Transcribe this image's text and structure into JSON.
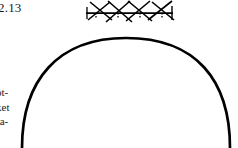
{
  "figure": {
    "number_label": "2.13",
    "caption_lines": [
      "ot-",
      "ket",
      "ra-"
    ],
    "ink_color": "#000000",
    "background_color": "#ffffff"
  },
  "drawing": {
    "arch": {
      "name": "semicircular-arch-curve",
      "left_springing_x": 22,
      "right_springing_x": 230,
      "apex_x": 126,
      "apex_y": 38,
      "baseline_y": 148,
      "stroke_width": 2.6
    },
    "support_hatch": {
      "name": "hatched-support-symbol",
      "line_y": 13,
      "line_start_x": 86,
      "line_end_x": 173,
      "stroke_width": 1.5,
      "cross_count": 3,
      "tick_count": 4,
      "description": "horizontal line with crossing diagonal hatch strokes"
    }
  }
}
